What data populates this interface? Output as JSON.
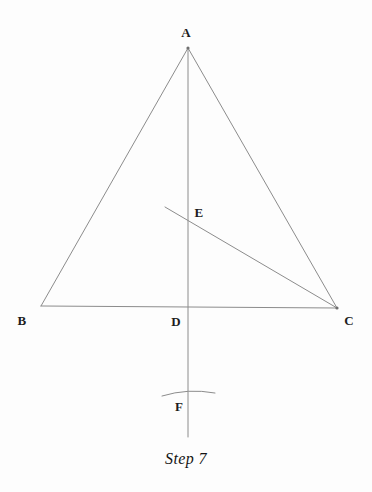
{
  "figure": {
    "title_caption": "Step 7",
    "points": {
      "A": {
        "label": "A",
        "x": 188,
        "y": 48,
        "label_x": 186,
        "label_y": 37
      },
      "B": {
        "label": "B",
        "x": 41,
        "y": 306,
        "label_x": 22,
        "label_y": 325
      },
      "C": {
        "label": "C",
        "x": 337,
        "y": 308,
        "label_x": 349,
        "label_y": 325
      },
      "D": {
        "label": "D",
        "x": 188,
        "y": 307,
        "label_x": 176,
        "label_y": 326
      },
      "E": {
        "label": "E",
        "x": 188,
        "y": 221,
        "label_x": 195,
        "label_y": 217
      },
      "F": {
        "label": "F",
        "x": 188,
        "y": 394,
        "label_x": 177,
        "label_y": 411
      }
    },
    "segments": [
      {
        "name": "side-AB",
        "from": "A",
        "to": "B"
      },
      {
        "name": "side-AC",
        "from": "A",
        "to": "C"
      },
      {
        "name": "base-BC",
        "from": "B",
        "to": "C"
      },
      {
        "name": "perpendicular-bisector-AF",
        "from": "A",
        "to": "F-extended"
      },
      {
        "name": "segment-EC",
        "from": "E-ray-start",
        "to": "C"
      }
    ],
    "vertical_line": {
      "x": 188,
      "y_top": 48,
      "y_bottom": 437
    },
    "ray_through_E": {
      "x1": 165,
      "y1": 207,
      "x2": 337,
      "y2": 308
    },
    "arc_at_F": {
      "x_start": 162,
      "y_start": 396,
      "x_end": 215,
      "y_end": 393,
      "peak_y": 390
    },
    "colors": {
      "line": "#8c8c8c",
      "label": "#1d1d1d",
      "background": "#fdfdfd",
      "caption": "#141414"
    }
  }
}
